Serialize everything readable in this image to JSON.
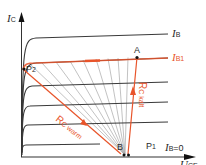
{
  "diagram": {
    "type": "transistor output characteristic with load lines",
    "colors": {
      "axis": "#333333",
      "curve": "#3a3a3a",
      "accent": "#e8542a",
      "fan": "#a8a8a8"
    },
    "axes": {
      "y_label": {
        "main": "I",
        "sub": "C"
      },
      "x_label": {
        "main": "U",
        "sub": "CE"
      }
    },
    "curve_labels": {
      "ib": {
        "main": "I",
        "sub": "B"
      },
      "ib1": {
        "main": "I",
        "sub": "B1"
      },
      "ib0": {
        "main": "I",
        "sub": "B",
        "suffix": "=0"
      }
    },
    "points": {
      "A": "A",
      "B": "B",
      "P1": {
        "main": "P",
        "sub": "1"
      },
      "P2": {
        "main": "P",
        "sub": "2"
      }
    },
    "load_lines": {
      "warm": {
        "main": "R",
        "sub": "C warm"
      },
      "cold": {
        "main": "R",
        "sub": "C kalt"
      }
    }
  }
}
